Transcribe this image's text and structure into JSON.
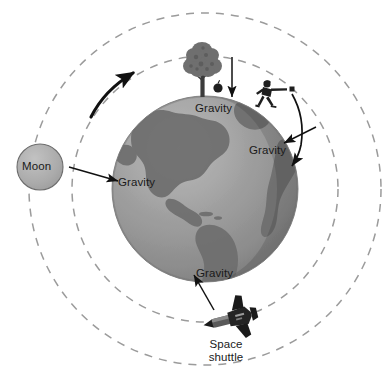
{
  "figure": {
    "type": "physics-diagram"
  },
  "colors": {
    "background": "#ffffff",
    "earth_ocean": "#9a9a9a",
    "earth_land": "#6e6e6e",
    "earth_highlight": "#b9b9b9",
    "earth_shadow": "#686868",
    "moon_fill": "#adadad",
    "moon_stroke": "#6d6d6d",
    "orbit_dash": "#9b9b9b",
    "arrow": "#111111",
    "text": "#1a1a1a",
    "shuttle": "#2b2b2b",
    "tree_foliage": "#6f6f6f",
    "tree_trunk": "#3c3c3c"
  },
  "bodies": {
    "earth": {
      "name": "earth",
      "cx": 205,
      "cy": 189,
      "r": 93
    },
    "moon": {
      "name": "moon",
      "label": "Moon",
      "cx": 40,
      "cy": 167,
      "r": 23
    }
  },
  "orbits": [
    {
      "name": "moon-orbit",
      "cx": 205,
      "cy": 189,
      "r": 176,
      "style": "dashed"
    },
    {
      "name": "shuttle-orbit",
      "cx": 205,
      "cy": 189,
      "r": 133,
      "style": "dashed"
    }
  ],
  "objects": {
    "tree": {
      "name": "tree",
      "x": 202,
      "y": 72
    },
    "apple": {
      "name": "falling-apple",
      "x": 218,
      "y": 88
    },
    "thrower": {
      "name": "person-throwing-ball",
      "x": 266,
      "y": 92
    },
    "ball": {
      "name": "thrown-ball",
      "x": 292,
      "y": 90
    },
    "shuttle": {
      "name": "space-shuttle",
      "label": "Space\nshuttle",
      "x": 226,
      "y": 320
    }
  },
  "labels": {
    "moon": "Moon",
    "gravity_top": "Gravity",
    "gravity_right": "Gravity",
    "gravity_left": "Gravity",
    "gravity_bottom": "Gravity",
    "shuttle_line1": "Space",
    "shuttle_line2": "shuttle"
  },
  "arrows": [
    {
      "name": "moon-gravity-arrow",
      "from": [
        70,
        168
      ],
      "to": [
        117,
        180
      ],
      "kind": "straight"
    },
    {
      "name": "apple-gravity-arrow",
      "from": [
        232,
        58
      ],
      "to": [
        232,
        97
      ],
      "kind": "straight"
    },
    {
      "name": "ball-gravity-arrow",
      "from": [
        314,
        128
      ],
      "to": [
        283,
        144
      ],
      "kind": "straight"
    },
    {
      "name": "ball-trajectory-arrow",
      "from": [
        293,
        92
      ],
      "to": [
        300,
        163
      ],
      "kind": "curved"
    },
    {
      "name": "shuttle-gravity-arrow",
      "from": [
        212,
        308
      ],
      "to": [
        193,
        276
      ],
      "kind": "straight"
    },
    {
      "name": "orbital-direction-arrow",
      "from": [
        93,
        112
      ],
      "to": [
        137,
        70
      ],
      "kind": "curved-thick"
    }
  ]
}
